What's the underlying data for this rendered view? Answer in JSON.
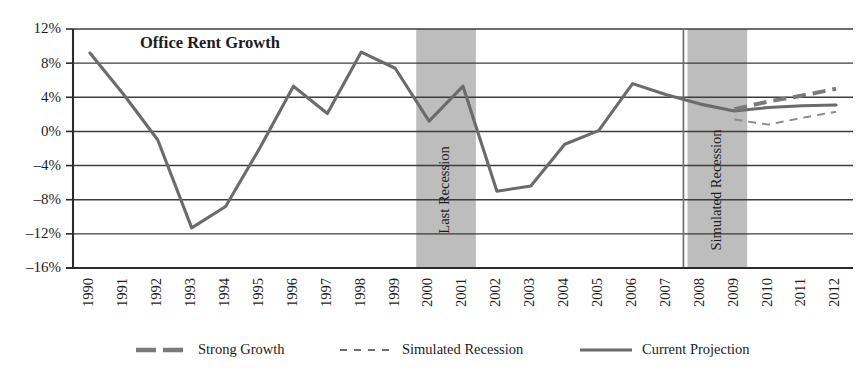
{
  "chart_data": {
    "type": "line",
    "title": "Office Rent Growth",
    "xlabel": "",
    "ylabel": "",
    "ylim": [
      -16,
      12
    ],
    "ytick_values": [
      12,
      8,
      4,
      0,
      -4,
      -8,
      -12,
      -16
    ],
    "ytick_labels": [
      "12%",
      "8%",
      "4%",
      "0%",
      "-4%",
      "-8%",
      "-12%",
      "-16%"
    ],
    "grid": true,
    "legend_position": "bottom",
    "categories": [
      "1990",
      "1991",
      "1992",
      "1993",
      "1994",
      "1995",
      "1996",
      "1997",
      "1998",
      "1999",
      "2000",
      "2001",
      "2002",
      "2003",
      "2004",
      "2005",
      "2006",
      "2007",
      "2008",
      "2009",
      "2010",
      "2011",
      "2012"
    ],
    "series": [
      {
        "name": "Current Projection",
        "style": "solid",
        "color": "#6b6b6b",
        "x": [
          "1990",
          "1991",
          "1992",
          "1993",
          "1994",
          "1995",
          "1996",
          "1997",
          "1998",
          "1999",
          "2000",
          "2001",
          "2002",
          "2003",
          "2004",
          "2005",
          "2006",
          "2007",
          "2008",
          "2009",
          "2010",
          "2011",
          "2012"
        ],
        "values": [
          9.2,
          4.3,
          -1.0,
          -11.3,
          -8.8,
          -2.0,
          5.3,
          2.1,
          9.3,
          7.4,
          1.2,
          5.3,
          -7.0,
          -6.4,
          -1.5,
          0.1,
          5.6,
          4.3,
          3.2,
          2.4,
          2.8,
          3.0,
          3.1
        ]
      },
      {
        "name": "Strong Growth",
        "style": "thick-dashed",
        "color": "#7a7a7a",
        "x": [
          "2009",
          "2010",
          "2011",
          "2012"
        ],
        "values": [
          2.6,
          3.5,
          4.2,
          5.0
        ]
      },
      {
        "name": "Simulated Recession",
        "style": "thin-dotted",
        "color": "#8a8a8a",
        "x": [
          "2009",
          "2010",
          "2011",
          "2012"
        ],
        "values": [
          1.4,
          0.8,
          1.6,
          2.3
        ]
      }
    ],
    "bands": [
      {
        "label": "Last Recession",
        "start": "2000",
        "end": "2001",
        "color": "#bdbdbd"
      },
      {
        "label": "Simulated Recession",
        "start": "2008",
        "end": "2009",
        "color": "#bdbdbd"
      }
    ],
    "annotations": [
      {
        "type": "vline",
        "at": "2007",
        "label": "",
        "color": "#6e6e6e"
      }
    ],
    "legend": [
      {
        "label": "Strong Growth",
        "style": "thick-dashed"
      },
      {
        "label": "Simulated Recession",
        "style": "thin-dotted"
      },
      {
        "label": "Current Projection",
        "style": "solid"
      }
    ]
  }
}
